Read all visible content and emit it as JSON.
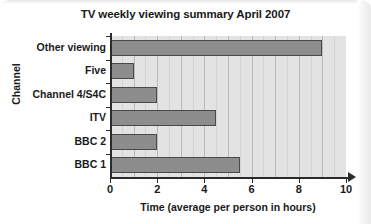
{
  "chart_data": {
    "type": "bar",
    "orientation": "horizontal",
    "title": "TV weekly viewing summary April 2007",
    "xlabel": "Time (average per person in hours)",
    "ylabel": "Channel",
    "categories": [
      "BBC 1",
      "BBC 2",
      "ITV",
      "Channel 4/S4C",
      "Five",
      "Other viewing"
    ],
    "values": [
      5.5,
      2.0,
      4.5,
      2.0,
      1.0,
      9.0
    ],
    "xlim": [
      0,
      10
    ],
    "xticks": [
      0,
      2,
      4,
      6,
      8,
      10
    ],
    "xtick_labels": [
      "0",
      "2",
      "4",
      "6",
      "8",
      "10"
    ],
    "grid": true,
    "grid_axis": "x",
    "legend": null,
    "bar_color": "#8d8d8d",
    "bar_edge_color": "#4a4a4a",
    "plot_background": "#e3e3e3",
    "gridline_color": "#b9b9b9",
    "axis_color": "#2b2b2b",
    "text_color": "#1a1a1a"
  }
}
